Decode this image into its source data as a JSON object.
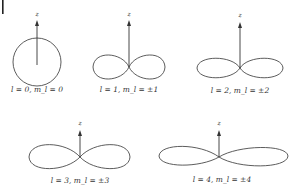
{
  "figure": {
    "panels": [
      {
        "id": "l0",
        "label": "l = 0, m_l = 0",
        "axis_label": "z",
        "shape": "sphere"
      },
      {
        "id": "l1",
        "label": "l = 1, m_l = ±1",
        "axis_label": "z",
        "shape": "two-lobe"
      },
      {
        "id": "l2",
        "label": "l = 2, m_l = ±2",
        "axis_label": "z",
        "shape": "two-lobe-flattened"
      },
      {
        "id": "l3",
        "label": "l = 3, m_l = ±3",
        "axis_label": "z",
        "shape": "figure-eight"
      },
      {
        "id": "l4",
        "label": "l = 4, m_l = ±4",
        "axis_label": "z",
        "shape": "figure-eight-flattened"
      }
    ],
    "colors": {
      "line": "#4a4a4a",
      "text": "#333333",
      "background": "#ffffff"
    }
  }
}
